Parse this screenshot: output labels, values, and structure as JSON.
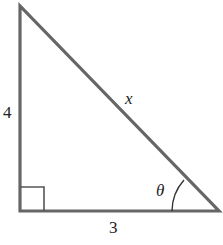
{
  "diagram": {
    "type": "right-triangle",
    "labels": {
      "vertical_leg": "4",
      "horizontal_leg": "3",
      "hypotenuse": "x",
      "angle": "θ"
    },
    "markers": {
      "right_angle": "bottom-left",
      "angle_theta": "bottom-right"
    },
    "colors": {
      "stroke": "#666666",
      "text": "#222222",
      "background": "#ffffff"
    }
  }
}
